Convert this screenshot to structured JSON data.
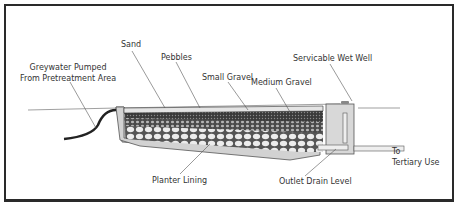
{
  "diagram": {
    "type": "cross-section",
    "labels": {
      "inlet_line1": "Greywater Pumped",
      "inlet_line2": "From Pretreatment Area",
      "sand": "Sand",
      "pebbles": "Pebbles",
      "small_gravel": "Small Gravel",
      "medium_gravel": "Medium Gravel",
      "wet_well": "Servicable Wet Well",
      "planter_lining": "Planter Lining",
      "outlet_drain": "Outlet Drain Level",
      "tertiary_line1": "To",
      "tertiary_line2": "Tertiary Use"
    },
    "colors": {
      "frame": "#2a2a2a",
      "lining": "#d2d2d2",
      "gravel_dark": "#3c3c3c",
      "pebble_light": "#e8e8e8",
      "well": "#d8d8d8",
      "line": "#555555"
    }
  }
}
